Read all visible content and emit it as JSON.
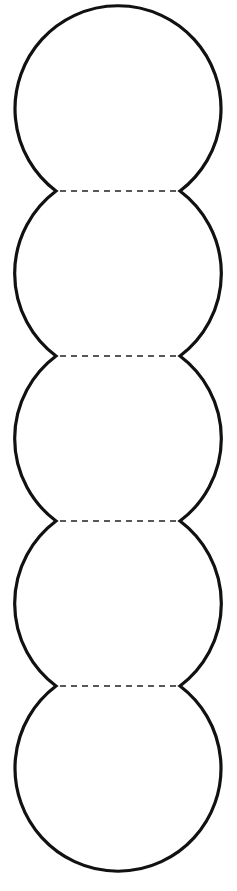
{
  "diagram": {
    "type": "chain-of-circles",
    "segment_count": 5,
    "fold_line_count": 4,
    "colors": {
      "background": "#ffffff",
      "outline": "#111111",
      "fold_line": "#222222"
    },
    "outline_style": "solid",
    "fold_line_style": "dashed"
  }
}
